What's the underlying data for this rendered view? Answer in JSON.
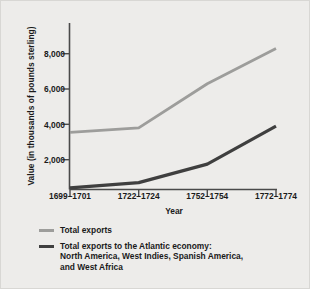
{
  "chart_data": {
    "type": "line",
    "title": "",
    "xlabel": "Year",
    "ylabel": "Value (in thousands of pounds sterling)",
    "categories": [
      "1699–1701",
      "1722–1724",
      "1752–1754",
      "1772–1774"
    ],
    "ylim": [
      0,
      9000
    ],
    "yticks": [
      2000,
      4000,
      6000,
      8000
    ],
    "ytick_labels": [
      "2,000",
      "4,000",
      "6,000",
      "8,000"
    ],
    "grid": false,
    "legend_position": "below",
    "series": [
      {
        "name": "Total exports",
        "color": "#9d9d9b",
        "values": [
          3550,
          3800,
          6300,
          8300
        ]
      },
      {
        "name": "Total exports to the Atlantic economy: North America, West Indies, Spanish America, and West Africa",
        "color": "#3f3f3f",
        "values": [
          400,
          700,
          1750,
          3900
        ]
      }
    ]
  },
  "axes": {
    "y_title": "Value (in thousands of pounds sterling)",
    "x_title": "Year",
    "y_tick_labels": [
      "8,000",
      "6,000",
      "4,000",
      "2,000"
    ],
    "x_tick_labels": [
      "1699–1701",
      "1722–1724",
      "1752–1754",
      "1772–1774"
    ]
  },
  "legend": {
    "items": [
      {
        "swatch": "light",
        "line1": "Total exports",
        "line2": "",
        "line3": ""
      },
      {
        "swatch": "dark",
        "line1": "Total exports to the Atlantic economy:",
        "line2": "North America, West Indies, Spanish America,",
        "line3": "and West Africa"
      }
    ]
  },
  "colors": {
    "background": "#edecea",
    "axis": "#4a4a4a",
    "series_light": "#9d9d9b",
    "series_dark": "#3f3f3f",
    "text": "#1a1a1a"
  }
}
